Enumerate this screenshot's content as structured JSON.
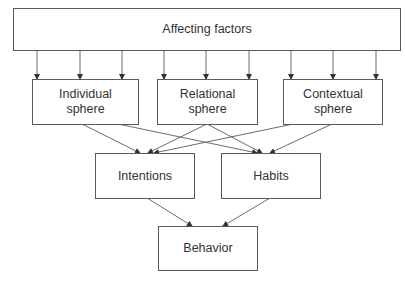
{
  "diagram": {
    "nodes": {
      "top": {
        "label": "Affecting factors"
      },
      "individual": {
        "label": "Individual\nsphere"
      },
      "relational": {
        "label": "Relational\nsphere"
      },
      "contextual": {
        "label": "Contextual\nsphere"
      },
      "intentions": {
        "label": "Intentions"
      },
      "habits": {
        "label": "Habits"
      },
      "behavior": {
        "label": "Behavior"
      }
    },
    "edges": [
      {
        "from": "Affecting factors",
        "to": "Individual sphere",
        "count": 3
      },
      {
        "from": "Affecting factors",
        "to": "Relational sphere",
        "count": 3
      },
      {
        "from": "Affecting factors",
        "to": "Contextual sphere",
        "count": 3
      },
      {
        "from": "Individual sphere",
        "to": "Intentions"
      },
      {
        "from": "Individual sphere",
        "to": "Habits"
      },
      {
        "from": "Relational sphere",
        "to": "Intentions"
      },
      {
        "from": "Relational sphere",
        "to": "Habits"
      },
      {
        "from": "Contextual sphere",
        "to": "Intentions"
      },
      {
        "from": "Contextual sphere",
        "to": "Habits"
      },
      {
        "from": "Intentions",
        "to": "Behavior"
      },
      {
        "from": "Habits",
        "to": "Behavior"
      }
    ],
    "colors": {
      "line": "#5a5a5a",
      "text": "#333333",
      "background": "#ffffff"
    }
  }
}
